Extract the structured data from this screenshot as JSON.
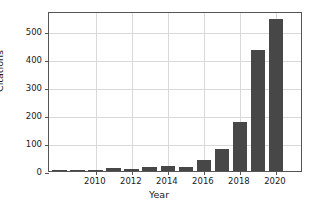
{
  "chart_data": {
    "type": "bar",
    "title": "",
    "xlabel": "Year",
    "ylabel": "Citations",
    "categories": [
      2008,
      2009,
      2010,
      2011,
      2012,
      2013,
      2014,
      2015,
      2016,
      2017,
      2018,
      2019,
      2020,
      2021
    ],
    "values": [
      1,
      2,
      3,
      9,
      7,
      13,
      19,
      16,
      40,
      80,
      176,
      433,
      545,
      0
    ],
    "xlim": [
      2007.4,
      2021.5
    ],
    "ylim": [
      0,
      572
    ],
    "x_ticks": [
      2010,
      2012,
      2014,
      2016,
      2018,
      2020
    ],
    "x_tick_labels": [
      "2010",
      "2012",
      "2014",
      "2016",
      "2018",
      "2020"
    ],
    "y_ticks": [
      0,
      100,
      200,
      300,
      400,
      500
    ],
    "y_tick_labels": [
      "0",
      "100",
      "200",
      "300",
      "400",
      "500"
    ],
    "grid": true,
    "legend": null,
    "bar_color": "#474747",
    "grid_color": "#d9d9d9",
    "axes_color": "#555555",
    "background": "#ffffff"
  }
}
